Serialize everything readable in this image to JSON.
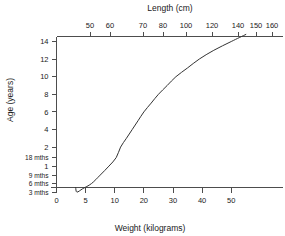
{
  "chart_data": {
    "type": "line",
    "title": "",
    "xlabel": "Weight (kilograms)",
    "ylabel": "Age (years)",
    "top_axis_label": "Length (cm)",
    "grid": false,
    "legend": "none",
    "axes": {
      "bottom": {
        "label": "Weight (kilograms)",
        "tick_labels": [
          "0",
          "5",
          "10",
          "20",
          "30",
          "40",
          "50"
        ],
        "tick_values": [
          0,
          5,
          10,
          20,
          30,
          40,
          50
        ],
        "scale": "nonlinear"
      },
      "top": {
        "label": "Length (cm)",
        "tick_labels": [
          "50",
          "60",
          "70",
          "80",
          "100",
          "120",
          "140",
          "150",
          "160"
        ],
        "tick_values": [
          50,
          60,
          70,
          80,
          100,
          120,
          140,
          150,
          160
        ],
        "scale": "nonlinear"
      },
      "left": {
        "label": "Age (years)",
        "tick_labels": [
          "14",
          "12",
          "10",
          "8",
          "6",
          "4",
          "2",
          "18 mths",
          "1",
          "9 mths",
          "6 mths",
          "3 mths"
        ],
        "tick_values_years": [
          14,
          12,
          10,
          8,
          6,
          4,
          2,
          1.5,
          1,
          0.75,
          0.5,
          0.25
        ],
        "scale": "nonlinear"
      }
    },
    "series": [
      {
        "name": "age-weight-length growth curve",
        "points": [
          {
            "weight": 3.5,
            "age_years": 0.25,
            "length_cm": 58
          },
          {
            "weight": 4.5,
            "age_years": 0.35,
            "length_cm": 62
          },
          {
            "weight": 6.0,
            "age_years": 0.5,
            "length_cm": 66
          },
          {
            "weight": 7.5,
            "age_years": 0.75,
            "length_cm": 71
          },
          {
            "weight": 9.0,
            "age_years": 1.0,
            "length_cm": 75
          },
          {
            "weight": 10.5,
            "age_years": 1.5,
            "length_cm": 81
          },
          {
            "weight": 12.0,
            "age_years": 2.0,
            "length_cm": 87
          },
          {
            "weight": 14.0,
            "age_years": 3.0,
            "length_cm": 95
          },
          {
            "weight": 16.0,
            "age_years": 4.0,
            "length_cm": 102
          },
          {
            "weight": 18.0,
            "age_years": 5.0,
            "length_cm": 109
          },
          {
            "weight": 20.0,
            "age_years": 6.0,
            "length_cm": 115
          },
          {
            "weight": 22.5,
            "age_years": 7.0,
            "length_cm": 121
          },
          {
            "weight": 25.0,
            "age_years": 8.0,
            "length_cm": 127
          },
          {
            "weight": 28.0,
            "age_years": 9.0,
            "length_cm": 132
          },
          {
            "weight": 31.0,
            "age_years": 10.0,
            "length_cm": 138
          },
          {
            "weight": 35.0,
            "age_years": 11.0,
            "length_cm": 143
          },
          {
            "weight": 39.0,
            "age_years": 12.0,
            "length_cm": 149
          },
          {
            "weight": 44.0,
            "age_years": 13.0,
            "length_cm": 155
          },
          {
            "weight": 50.0,
            "age_years": 14.0,
            "length_cm": 159
          },
          {
            "weight": 55.0,
            "age_years": 14.8,
            "length_cm": 160
          }
        ]
      }
    ],
    "colors": {
      "curve": "#333333",
      "axis": "#4d4d4d",
      "text": "#1a1a1a",
      "background": "#ffffff"
    }
  }
}
